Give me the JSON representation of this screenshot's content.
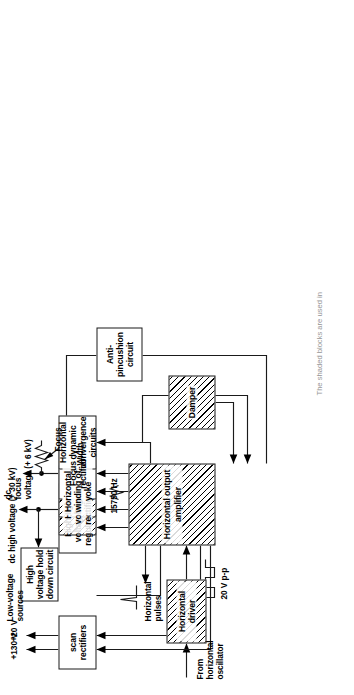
{
  "figure": {
    "caption": "The shaded blocks are used in"
  },
  "blocks": [
    {
      "id": "scan-rectifiers",
      "label": "scan  rectifiers",
      "shaded": false
    },
    {
      "id": "hv-hold-down",
      "label": "High voltage\nhold down circuit",
      "shaded": false
    },
    {
      "id": "anti-pincushion",
      "label": "Anti-pincushion\ncircuit",
      "shaded": false
    },
    {
      "id": "hv-regulator",
      "label": "High voltage\nregulator",
      "shaded": false
    },
    {
      "id": "hv-rectifier",
      "label": "High voltage\nrectifier",
      "shaded": true
    },
    {
      "id": "horizontal-winding",
      "label": "Horizontal winding\nof yoke",
      "shaded": true
    },
    {
      "id": "focus-rectifier",
      "label": "Focus\nrectifier",
      "shaded": false
    },
    {
      "id": "horizontal-convergence",
      "label": "Horizontal dynamic\nconvergence circuits",
      "shaded": false
    },
    {
      "id": "damper",
      "label": "Damper",
      "shaded": true
    },
    {
      "id": "horizontal-output-amp",
      "label": "Horizontal\noutput\namplifier",
      "shaded": true
    },
    {
      "id": "horizontal-driver",
      "label": "Horizontal\ndriver",
      "shaded": true
    }
  ],
  "labels": {
    "plus130v": "+130 V",
    "plus20v": "+20 V",
    "low_voltage_sources": "Low-voltage\nsources",
    "dc_high_voltage": "dc high voltage (+ 30 kV)",
    "width": "Width",
    "dc_focus_voltage": "dc\nfocus\nvoltage (+ 6 kV)",
    "focus": "Focus",
    "freq_15750": "15750 Hz",
    "horizontal_pulses": "Horizontal\npulses",
    "twenty_v_pp": "20 V p-p",
    "from_horizontal_oscillator": "From\nhorizontal\noscillator"
  },
  "colors": {
    "ink": "#1a1a1a",
    "paper": "#ffffff"
  }
}
